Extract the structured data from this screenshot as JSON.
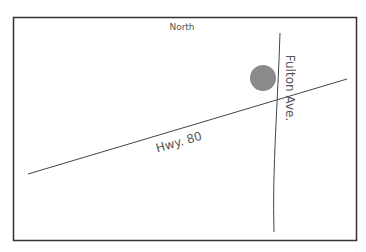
{
  "map": {
    "compass_label": "North",
    "roads": [
      {
        "name": "Hwy. 80"
      },
      {
        "name": "Fulton Ave."
      }
    ],
    "marker": {
      "color": "#8a8a8a"
    },
    "colors": {
      "frame": "#333333",
      "road": "#444444",
      "text": "#555555"
    }
  }
}
